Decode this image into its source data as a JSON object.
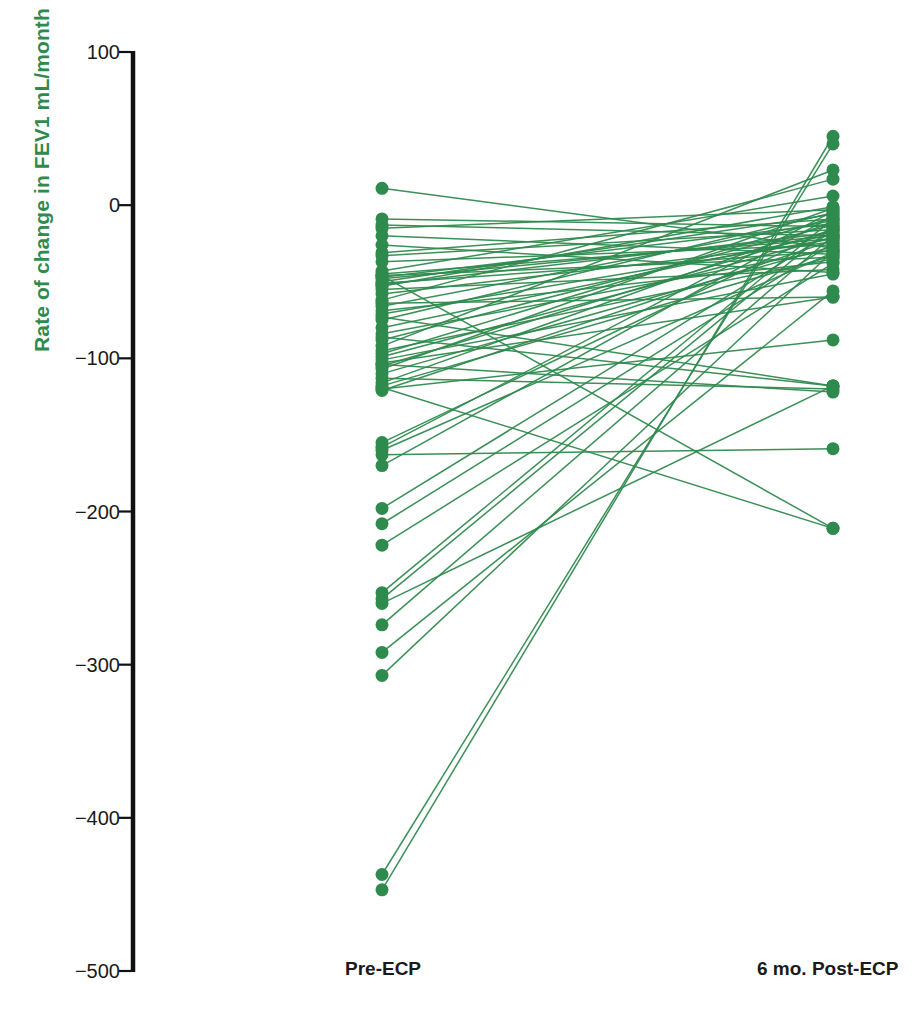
{
  "figure": {
    "background": "#ffffff",
    "series_color": "#2f8a4e",
    "axis_color": "#111111",
    "text_color": "#1a1a1a"
  },
  "axis": {
    "ylabel": "Rate of change in FEV1 mL/month",
    "ytick_labels": [
      "100",
      "0",
      "−100",
      "−200",
      "−300",
      "−400",
      "−500"
    ],
    "ytick_values": [
      100,
      0,
      -100,
      -200,
      -300,
      -400,
      -500
    ],
    "xtick_labels": [
      "Pre-ECP",
      "6 mo. Post-ECP"
    ]
  },
  "chart_data": {
    "type": "line",
    "subtype": "paired-slopegraph",
    "title": "",
    "xlabel": "",
    "ylabel": "Rate of change in FEV1 mL/month",
    "categories": [
      "Pre-ECP",
      "6 mo. Post-ECP"
    ],
    "tick_labels": [
      "100",
      "0",
      "−100",
      "−200",
      "−300",
      "−400",
      "−500"
    ],
    "ylim": [
      -500,
      100
    ],
    "ytick_step": 100,
    "grid": false,
    "legend": false,
    "marker": "circle",
    "color": "#2f8a4e",
    "n_pairs": 64,
    "pairs": [
      {
        "pre": 11,
        "post": -28
      },
      {
        "pre": -9,
        "post": -14
      },
      {
        "pre": -13,
        "post": -20
      },
      {
        "pre": -15,
        "post": -3
      },
      {
        "pre": -20,
        "post": -32
      },
      {
        "pre": -26,
        "post": -44
      },
      {
        "pre": -31,
        "post": -9
      },
      {
        "pre": -33,
        "post": -16
      },
      {
        "pre": -37,
        "post": -26
      },
      {
        "pre": -43,
        "post": 6
      },
      {
        "pre": -45,
        "post": -22
      },
      {
        "pre": -46,
        "post": -34
      },
      {
        "pre": -47,
        "post": -12
      },
      {
        "pre": -48,
        "post": -20
      },
      {
        "pre": -50,
        "post": -6
      },
      {
        "pre": -51,
        "post": -30
      },
      {
        "pre": -52,
        "post": -18
      },
      {
        "pre": -53,
        "post": -1
      },
      {
        "pre": -55,
        "post": -42
      },
      {
        "pre": -58,
        "post": -24
      },
      {
        "pre": -62,
        "post": 17
      },
      {
        "pre": -66,
        "post": -10
      },
      {
        "pre": -69,
        "post": -37
      },
      {
        "pre": -71,
        "post": -22
      },
      {
        "pre": -73,
        "post": -118
      },
      {
        "pre": -75,
        "post": -5
      },
      {
        "pre": -80,
        "post": -19
      },
      {
        "pre": -84,
        "post": -29
      },
      {
        "pre": -88,
        "post": -13
      },
      {
        "pre": -92,
        "post": 23
      },
      {
        "pre": -95,
        "post": -35
      },
      {
        "pre": -97,
        "post": -8
      },
      {
        "pre": -99,
        "post": -21
      },
      {
        "pre": -101,
        "post": -45
      },
      {
        "pre": -103,
        "post": -60
      },
      {
        "pre": -105,
        "post": -16
      },
      {
        "pre": -107,
        "post": -2
      },
      {
        "pre": -110,
        "post": -27
      },
      {
        "pre": -113,
        "post": -120
      },
      {
        "pre": -116,
        "post": -11
      },
      {
        "pre": -118,
        "post": -33
      },
      {
        "pre": -120,
        "post": -88
      },
      {
        "pre": -121,
        "post": -23
      },
      {
        "pre": -155,
        "post": -15
      },
      {
        "pre": -158,
        "post": -4
      },
      {
        "pre": -160,
        "post": -31
      },
      {
        "pre": -163,
        "post": -159
      },
      {
        "pre": -170,
        "post": -7
      },
      {
        "pre": -198,
        "post": -17
      },
      {
        "pre": -208,
        "post": -25
      },
      {
        "pre": -222,
        "post": -38
      },
      {
        "pre": -253,
        "post": -9
      },
      {
        "pre": -257,
        "post": -14
      },
      {
        "pre": -260,
        "post": -118
      },
      {
        "pre": -274,
        "post": -20
      },
      {
        "pre": -292,
        "post": -56
      },
      {
        "pre": -307,
        "post": -30
      },
      {
        "pre": -437,
        "post": 40
      },
      {
        "pre": -447,
        "post": 45
      },
      {
        "pre": -119,
        "post": -211
      },
      {
        "pre": -46,
        "post": -211
      },
      {
        "pre": -104,
        "post": -122
      },
      {
        "pre": -86,
        "post": -118
      },
      {
        "pre": -64,
        "post": -60
      }
    ]
  }
}
